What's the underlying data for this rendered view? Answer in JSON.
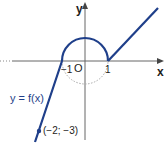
{
  "diagram": {
    "function_label": "y = f(x)",
    "axes": {
      "x_label": "x",
      "y_label": "y",
      "origin_label": "O"
    },
    "ticks": {
      "neg_one": "−1",
      "one": "1"
    },
    "point_label": "(−2; −3)",
    "pieces": [
      {
        "type": "line",
        "from": [
          -2,
          -3
        ],
        "to": [
          -1,
          0
        ],
        "note": "extends below (-2;-3)"
      },
      {
        "type": "upper semicircle",
        "center": [
          0,
          0
        ],
        "radius": 1
      },
      {
        "type": "line",
        "from": [
          1,
          0
        ],
        "slope": 1
      }
    ],
    "dashed": "lower semicircle (dotted, not part of graph)",
    "colors": {
      "curve": "#1f3f8a",
      "axis": "#555555",
      "dotted": "#aaaaaa"
    }
  }
}
